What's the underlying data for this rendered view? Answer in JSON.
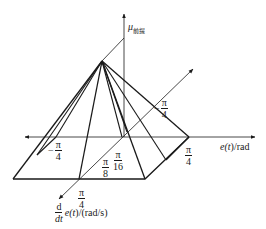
{
  "diagram": {
    "type": "3d-membership-pyramid",
    "axes": {
      "vertical": {
        "symbol": "μ",
        "subscript": "前提"
      },
      "horizontal": {
        "label_pre": "e(",
        "label_var": "t",
        "label_post": ")/rad"
      },
      "depth": {
        "d_num": "d",
        "d_den": "dt",
        "label_pre": "e(",
        "label_var": "t",
        "label_post": ")/(rad/s)"
      }
    },
    "tick_labels": {
      "left_neg": {
        "sign": "−",
        "num": "π",
        "den": "4"
      },
      "right_pos": {
        "num": "π",
        "den": "4"
      },
      "depth_neg": {
        "sign": "−",
        "num": "π",
        "den": "4"
      },
      "depth_pos": {
        "num": "π",
        "den": "4"
      },
      "inner_8": {
        "num": "π",
        "den": "8"
      },
      "inner_16": {
        "num": "π",
        "den": "16"
      }
    },
    "colors": {
      "line": "#1a1a1a",
      "background": "#ffffff"
    }
  }
}
